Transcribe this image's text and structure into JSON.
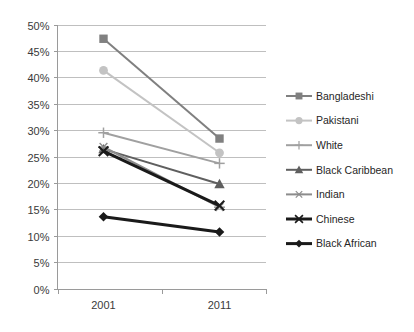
{
  "chart_data": {
    "type": "line",
    "title": "",
    "subtitle": "",
    "xlabel": "",
    "ylabel": "",
    "categories": [
      "2001",
      "2011"
    ],
    "x": [
      2001,
      2011
    ],
    "ylim": [
      0,
      50
    ],
    "ytick_step": 5,
    "ytick_labels": [
      "0%",
      "5%",
      "10%",
      "15%",
      "20%",
      "25%",
      "30%",
      "35%",
      "40%",
      "45%",
      "50%"
    ],
    "ytick_values": [
      0,
      5,
      10,
      15,
      20,
      25,
      30,
      35,
      40,
      45,
      50
    ],
    "grid": "horizontal",
    "legend_position": "right",
    "value_suffix": "%",
    "series": [
      {
        "name": "Bangladeshi",
        "values": [
          47.3,
          28.4
        ],
        "color": "#808080",
        "marker": "square"
      },
      {
        "name": "Pakistani",
        "values": [
          41.3,
          25.7
        ],
        "color": "#c3c3c3",
        "marker": "circle"
      },
      {
        "name": "White",
        "values": [
          29.5,
          23.7
        ],
        "color": "#a0a0a0",
        "marker": "plus"
      },
      {
        "name": "Black Caribbean",
        "values": [
          26.4,
          19.8
        ],
        "color": "#5f5f5f",
        "marker": "triangle"
      },
      {
        "name": "Indian",
        "values": [
          26.8,
          15.4
        ],
        "color": "#8c8c8c",
        "marker": "asterisk"
      },
      {
        "name": "Chinese",
        "values": [
          26.0,
          15.7
        ],
        "color": "#1a1a1a",
        "marker": "cross"
      },
      {
        "name": "Black African",
        "values": [
          13.6,
          10.7
        ],
        "color": "#1a1a1a",
        "marker": "diamond"
      }
    ]
  },
  "axes": {
    "x_tick_labels": [
      "2001",
      "2011"
    ],
    "y_tick_labels": [
      "50%",
      "45%",
      "40%",
      "35%",
      "30%",
      "25%",
      "20%",
      "15%",
      "10%",
      "5%",
      "0%"
    ]
  },
  "legend": {
    "items": [
      {
        "label": "Bangladeshi"
      },
      {
        "label": "Pakistani"
      },
      {
        "label": "White"
      },
      {
        "label": "Black Caribbean"
      },
      {
        "label": "Indian"
      },
      {
        "label": "Chinese"
      },
      {
        "label": "Black African"
      }
    ]
  }
}
